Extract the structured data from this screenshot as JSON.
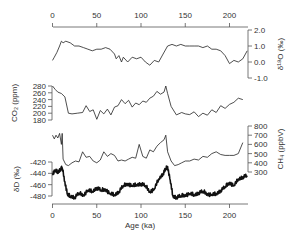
{
  "chart_data": {
    "type": "line",
    "title": "",
    "xlabel": "Age (ka)",
    "x_ticks": [
      0,
      50,
      100,
      150,
      200
    ],
    "xlim": [
      0,
      220
    ],
    "panels": [
      {
        "name": "d18O",
        "ylabel": "δ18O (‰)",
        "axis_side": "right",
        "y_ticks": [
          "2.0",
          "1.0",
          "0.0",
          "-1.0"
        ],
        "ylim": [
          -1.0,
          2.0
        ],
        "series": [
          {
            "name": "δ18O",
            "x": [
              0,
              2,
              5,
              8,
              10,
              12,
              15,
              20,
              25,
              30,
              35,
              40,
              45,
              50,
              55,
              60,
              65,
              70,
              72,
              75,
              78,
              80,
              85,
              90,
              95,
              100,
              105,
              110,
              115,
              120,
              125,
              130,
              135,
              140,
              145,
              150,
              155,
              160,
              165,
              170,
              175,
              180,
              185,
              190,
              195,
              200,
              205,
              210,
              215,
              220
            ],
            "values": [
              0.1,
              0.3,
              0.6,
              1.0,
              1.3,
              1.2,
              1.3,
              1.2,
              1.0,
              1.0,
              0.9,
              0.8,
              0.7,
              0.8,
              0.8,
              0.9,
              0.8,
              0.5,
              0.2,
              0.4,
              0.0,
              0.3,
              0.0,
              0.3,
              0.2,
              0.3,
              0.0,
              -0.2,
              0.1,
              0.0,
              0.5,
              1.0,
              1.1,
              1.0,
              1.1,
              1.0,
              1.0,
              1.0,
              1.0,
              0.9,
              1.0,
              0.8,
              0.8,
              0.7,
              0.4,
              -0.1,
              0.1,
              0.0,
              0.2,
              0.7
            ]
          }
        ]
      },
      {
        "name": "CO2",
        "ylabel": "CO2 (ppm)",
        "axis_side": "left",
        "y_ticks": [
          "280",
          "260",
          "240",
          "220",
          "200",
          "180"
        ],
        "ylim": [
          180,
          280
        ],
        "series": [
          {
            "name": "CO2",
            "x": [
              0,
              3,
              6,
              10,
              14,
              18,
              22,
              28,
              34,
              38,
              42,
              46,
              50,
              54,
              58,
              62,
              66,
              70,
              74,
              78,
              82,
              86,
              90,
              94,
              98,
              102,
              106,
              110,
              114,
              118,
              122,
              126,
              128,
              130,
              134,
              140,
              146,
              150,
              155,
              160,
              165,
              170,
              175,
              180,
              185,
              190,
              195,
              200,
              205,
              210,
              215
            ],
            "values": [
              280,
              270,
              262,
              258,
              248,
              200,
              198,
              200,
              202,
              222,
              205,
              210,
              182,
              208,
              198,
              212,
              195,
              218,
              222,
              240,
              228,
              238,
              218,
              230,
              225,
              236,
              232,
              244,
              250,
              264,
              256,
              262,
              280,
              258,
              220,
              195,
              202,
              198,
              196,
              204,
              190,
              200,
              194,
              210,
              202,
              222,
              214,
              226,
              232,
              244,
              240
            ]
          }
        ]
      },
      {
        "name": "CH4",
        "ylabel": "CH4 (ppbV)",
        "axis_side": "right",
        "y_ticks": [
          "800",
          "700",
          "600",
          "500",
          "400",
          "300"
        ],
        "ylim": [
          300,
          800
        ],
        "series": [
          {
            "name": "CH4",
            "x": [
              0,
              2,
              4,
              6,
              8,
              10,
              11,
              12,
              13,
              15,
              18,
              22,
              26,
              30,
              34,
              38,
              42,
              46,
              50,
              54,
              58,
              62,
              66,
              70,
              74,
              78,
              82,
              86,
              90,
              94,
              98,
              102,
              106,
              110,
              114,
              118,
              122,
              126,
              128,
              130,
              134,
              138,
              142,
              146,
              150,
              155,
              160,
              165,
              170,
              175,
              180,
              185,
              190,
              195,
              200,
              205,
              210,
              215
            ],
            "values": [
              700,
              660,
              700,
              670,
              720,
              600,
              720,
              440,
              420,
              380,
              370,
              400,
              420,
              410,
              520,
              460,
              470,
              420,
              400,
              430,
              520,
              470,
              500,
              480,
              420,
              430,
              420,
              440,
              460,
              450,
              600,
              470,
              450,
              540,
              520,
              580,
              620,
              650,
              700,
              520,
              420,
              370,
              380,
              400,
              420,
              420,
              440,
              430,
              470,
              460,
              500,
              520,
              490,
              480,
              480,
              480,
              500,
              620
            ]
          }
        ]
      },
      {
        "name": "dD",
        "ylabel": "δD (‰)",
        "axis_side": "left",
        "y_ticks": [
          "-420",
          "-440",
          "-460",
          "-480"
        ],
        "ylim": [
          -490,
          -415
        ],
        "series": [
          {
            "name": "δD",
            "x": [
              0,
              3,
              6,
              9,
              11,
              14,
              17,
              20,
              25,
              30,
              35,
              40,
              45,
              50,
              55,
              60,
              65,
              70,
              75,
              80,
              85,
              90,
              95,
              100,
              105,
              110,
              115,
              120,
              125,
              128,
              130,
              133,
              136,
              140,
              145,
              150,
              155,
              160,
              165,
              170,
              175,
              180,
              185,
              190,
              195,
              200,
              205,
              210,
              215,
              220
            ],
            "values": [
              -440,
              -435,
              -438,
              -432,
              -430,
              -455,
              -478,
              -480,
              -482,
              -475,
              -478,
              -470,
              -472,
              -465,
              -470,
              -468,
              -476,
              -478,
              -472,
              -462,
              -458,
              -462,
              -460,
              -458,
              -462,
              -472,
              -468,
              -450,
              -440,
              -432,
              -428,
              -452,
              -480,
              -482,
              -480,
              -478,
              -476,
              -478,
              -474,
              -472,
              -476,
              -478,
              -476,
              -470,
              -464,
              -456,
              -462,
              -450,
              -446,
              -444
            ]
          }
        ]
      }
    ]
  },
  "axes": {
    "top": {
      "ticks": [
        "0",
        "50",
        "100",
        "150",
        "200"
      ]
    },
    "bottom": {
      "ticks": [
        "0",
        "50",
        "100",
        "150",
        "200"
      ],
      "label": "Age (ka)"
    },
    "d18O": {
      "label": "δ¹⁸O (‰)",
      "ticks": [
        "2.0",
        "1.0",
        "0.0",
        "-1.0"
      ]
    },
    "co2": {
      "label": "CO₂ (ppm)",
      "ticks": [
        "280",
        "260",
        "240",
        "220",
        "200",
        "180"
      ]
    },
    "ch4": {
      "label": "CH₄ (ppbV)",
      "ticks": [
        "800",
        "700",
        "600",
        "500",
        "400",
        "300"
      ]
    },
    "dd": {
      "label": "δD (‰)",
      "ticks": [
        "-420",
        "-440",
        "-460",
        "-480"
      ]
    }
  }
}
